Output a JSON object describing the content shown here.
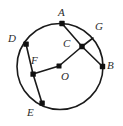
{
  "figure": {
    "type": "geometry-diagram",
    "canvas": {
      "width": 123,
      "height": 126
    },
    "colors": {
      "background": "#ffffff",
      "stroke": "#1a1a1a",
      "label_text": "#2b2b2b",
      "vertex_fill": "#111111"
    },
    "circle": {
      "cx": 60,
      "cy": 66.5,
      "r": 43,
      "stroke_width": 1.6
    },
    "points": [
      {
        "id": "A",
        "label": "A",
        "x": 62,
        "y": 23.5,
        "on_circle": true,
        "dot": true,
        "label_x": 58,
        "label_y": 7
      },
      {
        "id": "G",
        "label": "G",
        "x": 93,
        "y": 38,
        "on_circle": true,
        "dot": false,
        "label_x": 95,
        "label_y": 21
      },
      {
        "id": "C",
        "label": "C",
        "x": 82,
        "y": 46.5,
        "on_circle": false,
        "dot": true,
        "label_x": 63,
        "label_y": 38
      },
      {
        "id": "B",
        "label": "B",
        "x": 102.5,
        "y": 66.5,
        "on_circle": true,
        "dot": true,
        "label_x": 107,
        "label_y": 60
      },
      {
        "id": "O",
        "label": "O",
        "x": 59,
        "y": 66,
        "on_circle": false,
        "dot": true,
        "label_x": 61,
        "label_y": 71
      },
      {
        "id": "F",
        "label": "F",
        "x": 33,
        "y": 74,
        "on_circle": false,
        "dot": true,
        "label_x": 31,
        "label_y": 55
      },
      {
        "id": "D",
        "label": "D",
        "x": 26,
        "y": 44,
        "on_circle": true,
        "dot": true,
        "label_x": 8,
        "label_y": 33
      },
      {
        "id": "E",
        "label": "E",
        "x": 42,
        "y": 103,
        "on_circle": true,
        "dot": true,
        "label_x": 27,
        "label_y": 107
      }
    ],
    "segments": [
      {
        "name": "segment-A-C",
        "from": "A",
        "to": "C"
      },
      {
        "name": "segment-C-B",
        "from": "C",
        "to": "B"
      },
      {
        "name": "segment-C-G",
        "from": "C",
        "to": "G"
      },
      {
        "name": "segment-C-O",
        "from": "C",
        "to": "O"
      },
      {
        "name": "segment-O-F",
        "from": "O",
        "to": "F"
      },
      {
        "name": "segment-F-D",
        "from": "F",
        "to": "D"
      },
      {
        "name": "segment-F-E",
        "from": "F",
        "to": "E"
      }
    ]
  }
}
